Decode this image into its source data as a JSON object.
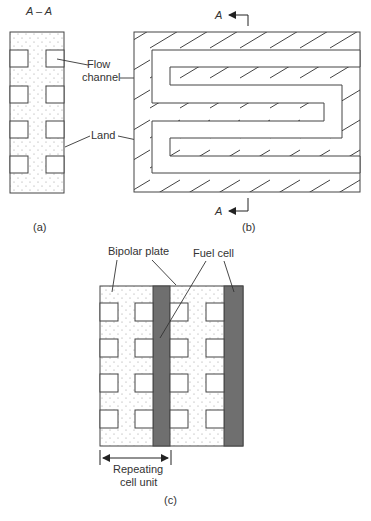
{
  "figure": {
    "panel_a": {
      "section_label": "A – A",
      "caption": "(a)",
      "callouts": {
        "flow_channel": [
          "Flow",
          "channel"
        ],
        "land": "Land"
      }
    },
    "panel_b": {
      "section_marker_top": "A",
      "section_marker_bottom": "A",
      "caption": "(b)"
    },
    "panel_c": {
      "bipolar_plate_label": "Bipolar plate",
      "fuel_cell_label": "Fuel cell",
      "repeating_unit_label": [
        "Repeating",
        "cell unit"
      ],
      "caption": "(c)"
    },
    "colors": {
      "stroke": "#444444",
      "fuel_cell": "#6f6f6f",
      "stipple": "#9a9a9a"
    }
  }
}
